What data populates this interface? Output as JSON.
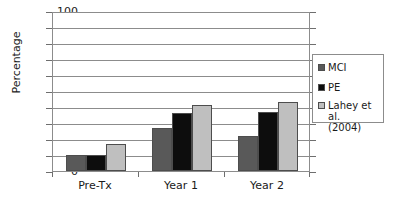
{
  "chart_data": {
    "type": "bar",
    "title": "",
    "subtitle": "",
    "xlabel": "",
    "ylabel": "Percentage",
    "ylim": [
      0,
      100
    ],
    "ytick_step": 10,
    "yticks": [
      100,
      90,
      80,
      70,
      60,
      50,
      40,
      30,
      20,
      10,
      0
    ],
    "categories": [
      "Pre-Tx",
      "Year 1",
      "Year 2"
    ],
    "grid": "horizontal",
    "legend_position": "right",
    "series": [
      {
        "name": "MCI",
        "color": "#595959",
        "values": [
          10,
          27,
          22
        ]
      },
      {
        "name": "PE",
        "color": "#0d0d0d",
        "values": [
          10,
          36,
          37
        ]
      },
      {
        "name": "Lahey et al.\n(2004)",
        "color": "#bfbfbf",
        "values": [
          17,
          41,
          43
        ]
      }
    ]
  },
  "legend": {
    "entries": [
      {
        "label": "MCI",
        "color": "#595959"
      },
      {
        "label": "PE",
        "color": "#0d0d0d"
      },
      {
        "label": "Lahey et al.\n(2004)",
        "color": "#bfbfbf"
      }
    ]
  },
  "colors": {
    "mci": "#595959",
    "pe": "#0d0d0d",
    "lahey": "#bfbfbf",
    "axis": "#8c8c8c",
    "text": "#1a1a1a",
    "background": "#ffffff"
  }
}
